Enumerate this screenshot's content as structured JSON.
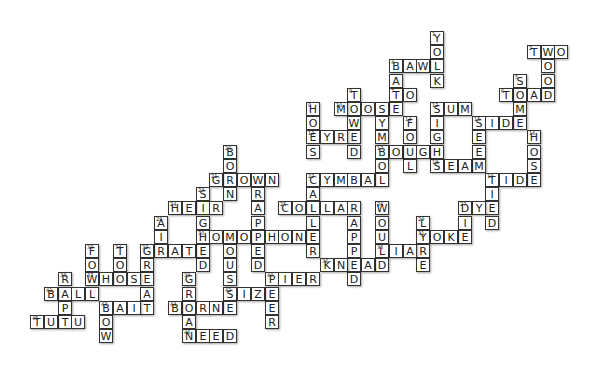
{
  "puzzle": {
    "type": "crossword",
    "grid_origin": {
      "x": 30,
      "y": 31
    },
    "cell_size": {
      "w": 13.8,
      "h": 14.2
    },
    "words": [
      {
        "num": "1",
        "word": "YOLK",
        "dir": "down",
        "col": 29,
        "row": 0
      },
      {
        "num": "2",
        "word": "TWO",
        "dir": "across",
        "col": 36,
        "row": 1
      },
      {
        "num": "",
        "word": "WOOD",
        "dir": "down",
        "col": 37,
        "row": 1
      },
      {
        "num": "4",
        "word": "BAWL",
        "dir": "across",
        "col": 26,
        "row": 2
      },
      {
        "num": "",
        "word": "BATE",
        "dir": "down",
        "col": 26,
        "row": 2
      },
      {
        "num": "5",
        "word": "SOME",
        "dir": "down",
        "col": 35,
        "row": 3
      },
      {
        "num": "6",
        "word": "TOAD",
        "dir": "across",
        "col": 34,
        "row": 4
      },
      {
        "num": "7",
        "word": "TO",
        "dir": "across",
        "col": 26,
        "row": 4
      },
      {
        "num": "8",
        "word": "TOWED",
        "dir": "down",
        "col": 23,
        "row": 4
      },
      {
        "num": "9",
        "word": "HOES",
        "dir": "down",
        "col": 20,
        "row": 5
      },
      {
        "num": "10",
        "word": "MOOSE",
        "dir": "across",
        "col": 22,
        "row": 5
      },
      {
        "num": "",
        "word": "SYMBOL",
        "dir": "down",
        "col": 25,
        "row": 5
      },
      {
        "num": "12",
        "word": "SUM",
        "dir": "across",
        "col": 29,
        "row": 5
      },
      {
        "num": "",
        "word": "SIGHS",
        "dir": "down",
        "col": 29,
        "row": 5
      },
      {
        "num": "13",
        "word": "EYRE",
        "dir": "across",
        "col": 20,
        "row": 7
      },
      {
        "num": "14",
        "word": "FOUL",
        "dir": "down",
        "col": 27,
        "row": 6
      },
      {
        "num": "15",
        "word": "SIDE",
        "dir": "across",
        "col": 32,
        "row": 6
      },
      {
        "num": "",
        "word": "SEEM",
        "dir": "down",
        "col": 32,
        "row": 6
      },
      {
        "num": "16",
        "word": "HOSE",
        "dir": "down",
        "col": 36,
        "row": 7
      },
      {
        "num": "17",
        "word": "BOUGH",
        "dir": "across",
        "col": 25,
        "row": 8
      },
      {
        "num": "18",
        "word": "SEAM",
        "dir": "across",
        "col": 29,
        "row": 9
      },
      {
        "num": "19",
        "word": "TIDE",
        "dir": "across",
        "col": 33,
        "row": 10
      },
      {
        "num": "",
        "word": "TIED",
        "dir": "down",
        "col": 33,
        "row": 10
      },
      {
        "num": "20",
        "word": "BORN",
        "dir": "down",
        "col": 14,
        "row": 8
      },
      {
        "num": "21",
        "word": "GROWN",
        "dir": "across",
        "col": 13,
        "row": 10
      },
      {
        "num": "",
        "word": "WRAPPED",
        "dir": "down",
        "col": 16,
        "row": 10
      },
      {
        "num": "22",
        "word": "CYMBAL",
        "dir": "across",
        "col": 20,
        "row": 10
      },
      {
        "num": "",
        "word": "CALLER",
        "dir": "down",
        "col": 20,
        "row": 10
      },
      {
        "num": "23",
        "word": "SIGHED",
        "dir": "down",
        "col": 12,
        "row": 11
      },
      {
        "num": "24",
        "word": "HEIR",
        "dir": "across",
        "col": 10,
        "row": 12
      },
      {
        "num": "25",
        "word": "COLLAR",
        "dir": "across",
        "col": 18,
        "row": 12
      },
      {
        "num": "",
        "word": "RAPPED",
        "dir": "down",
        "col": 23,
        "row": 12
      },
      {
        "num": "26",
        "word": "WOULD",
        "dir": "down",
        "col": 25,
        "row": 12
      },
      {
        "num": "27",
        "word": "DYE",
        "dir": "across",
        "col": 31,
        "row": 12
      },
      {
        "num": "",
        "word": "DIE",
        "dir": "down",
        "col": 31,
        "row": 12
      },
      {
        "num": "28",
        "word": "AIR",
        "dir": "down",
        "col": 9,
        "row": 13
      },
      {
        "num": "29",
        "word": "LYRE",
        "dir": "down",
        "col": 28,
        "row": 13
      },
      {
        "num": "30",
        "word": "HOMOPHONE",
        "dir": "across",
        "col": 12,
        "row": 14
      },
      {
        "num": "",
        "word": "MOUSSE",
        "dir": "down",
        "col": 14,
        "row": 14
      },
      {
        "num": "31",
        "word": "YOKE",
        "dir": "across",
        "col": 28,
        "row": 14
      },
      {
        "num": "32",
        "word": "GRATE",
        "dir": "across",
        "col": 8,
        "row": 15
      },
      {
        "num": "",
        "word": "GREAT",
        "dir": "down",
        "col": 8,
        "row": 15
      },
      {
        "num": "33",
        "word": "FOW",
        "dir": "down",
        "col": 4,
        "row": 15
      },
      {
        "num": "34",
        "word": "TOO",
        "dir": "down",
        "col": 6,
        "row": 15
      },
      {
        "num": "35",
        "word": "LIAR",
        "dir": "across",
        "col": 25,
        "row": 15
      },
      {
        "num": "36",
        "word": "KNEAD",
        "dir": "across",
        "col": 21,
        "row": 16
      },
      {
        "num": "37",
        "word": "WHOSE",
        "dir": "across",
        "col": 4,
        "row": 17
      },
      {
        "num": "38",
        "word": "RAPT",
        "dir": "down",
        "col": 2,
        "row": 17
      },
      {
        "num": "39",
        "word": "GROAN",
        "dir": "down",
        "col": 11,
        "row": 17
      },
      {
        "num": "40",
        "word": "PIER",
        "dir": "across",
        "col": 17,
        "row": 17
      },
      {
        "num": "",
        "word": "PEER",
        "dir": "down",
        "col": 17,
        "row": 17
      },
      {
        "num": "41",
        "word": "BALL",
        "dir": "across",
        "col": 1,
        "row": 18
      },
      {
        "num": "42",
        "word": "SIZE",
        "dir": "across",
        "col": 14,
        "row": 18
      },
      {
        "num": "43",
        "word": "BAIT",
        "dir": "across",
        "col": 5,
        "row": 19
      },
      {
        "num": "",
        "word": "BOW",
        "dir": "down",
        "col": 5,
        "row": 19
      },
      {
        "num": "44",
        "word": "BORNE",
        "dir": "across",
        "col": 10,
        "row": 19
      },
      {
        "num": "45",
        "word": "TUTU",
        "dir": "across",
        "col": 0,
        "row": 20
      },
      {
        "num": "46",
        "word": "NEED",
        "dir": "across",
        "col": 11,
        "row": 21
      }
    ]
  }
}
